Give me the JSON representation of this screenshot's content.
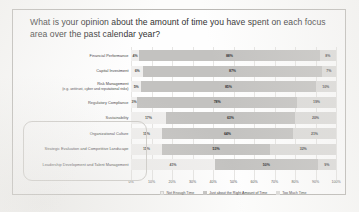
{
  "slide": {
    "title": "What is your opinion about the amount of time you have spent on each focus area over the past calendar year?"
  },
  "chart_data": {
    "type": "bar",
    "subtype": "stacked-horizontal-100",
    "title": "What is your opinion about the amount of time you have spent on each focus area over the past calendar year?",
    "xlabel": "",
    "ylabel": "",
    "xlim": [
      0,
      100
    ],
    "grid": true,
    "legend_position": "bottom",
    "tick_labels": [
      "0%",
      "10%",
      "20%",
      "30%",
      "40%",
      "50%",
      "60%",
      "70%",
      "80%",
      "90%",
      "100%"
    ],
    "categories": [
      "Financial Performance",
      "Capital Investment",
      "Risk Management",
      "Regulatory Compliance",
      "Sustainability",
      "Organizational Culture",
      "Strategic Evaluation and Competitive Landscape",
      "Leadership Development and Talent Management"
    ],
    "category_sublabels": [
      "",
      "",
      "(e.g. antitrust, cyber and reputational risks)",
      "",
      "",
      "",
      "",
      ""
    ],
    "series": [
      {
        "name": "Not Enough Time",
        "color": "#f0efee",
        "values": [
          4,
          6,
          5,
          3,
          17,
          15,
          15,
          41
        ]
      },
      {
        "name": "Just about the Right Amount of Time",
        "color": "#c3c2c0",
        "values": [
          88,
          87,
          85,
          78,
          63,
          64,
          53,
          50
        ]
      },
      {
        "name": "Too Much Time",
        "color": "#dcdbd9",
        "values": [
          8,
          7,
          10,
          19,
          20,
          21,
          32,
          9
        ]
      }
    ],
    "series_labels": [
      {
        "a": "4%",
        "b": "88%",
        "c": "8%"
      },
      {
        "a": "6%",
        "b": "87%",
        "c": "7%"
      },
      {
        "a": "5%",
        "b": "85%",
        "c": "10%"
      },
      {
        "a": "3%",
        "b": "78%",
        "c": "19%"
      },
      {
        "a": "17%",
        "b": "63%",
        "c": "20%"
      },
      {
        "a": "15%",
        "b": "64%",
        "c": "21%"
      },
      {
        "a": "15%",
        "b": "53%",
        "c": "32%"
      },
      {
        "a": "41%",
        "b": "50%",
        "c": "9%"
      }
    ],
    "legend": [
      "Not Enough Time",
      "Just about the Right Amount of Time",
      "Too Much Time"
    ]
  }
}
